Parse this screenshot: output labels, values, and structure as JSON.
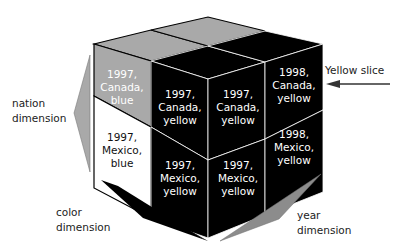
{
  "diagram": {
    "cells": [
      {
        "id": "c1",
        "lines": [
          "1997,",
          "Canada,",
          "blue"
        ],
        "fill": "#a9a9a9",
        "text": "#ffffff"
      },
      {
        "id": "c2",
        "lines": [
          "1997,",
          "Canada,",
          "yellow"
        ],
        "fill": "#000000",
        "text": "#ffffff"
      },
      {
        "id": "c3",
        "lines": [
          "1997,",
          "Canada,",
          "yellow"
        ],
        "fill": "#000000",
        "text": "#ffffff"
      },
      {
        "id": "c4",
        "lines": [
          "1998,",
          "Canada,",
          "yellow"
        ],
        "fill": "#000000",
        "text": "#ffffff"
      },
      {
        "id": "c5",
        "lines": [
          "1997,",
          "Mexico,",
          "blue"
        ],
        "fill": "#ffffff",
        "text": "#111111"
      },
      {
        "id": "c6",
        "lines": [
          "1997,",
          "Mexico,",
          "yellow"
        ],
        "fill": "#000000",
        "text": "#ffffff"
      },
      {
        "id": "c7",
        "lines": [
          "1997,",
          "Mexico,",
          "yellow"
        ],
        "fill": "#000000",
        "text": "#ffffff"
      },
      {
        "id": "c8",
        "lines": [
          "1998,",
          "Mexico,",
          "yellow"
        ],
        "fill": "#000000",
        "text": "#ffffff"
      }
    ],
    "labels": {
      "yellow_slice": "Yellow slice",
      "nation": [
        "nation",
        "dimension"
      ],
      "color": [
        "color",
        "dimension"
      ],
      "year": [
        "year",
        "dimension"
      ]
    },
    "colors": {
      "gray": "#a9a9a9",
      "black": "#000000",
      "arrow_gray": "#8c8c8c"
    }
  }
}
